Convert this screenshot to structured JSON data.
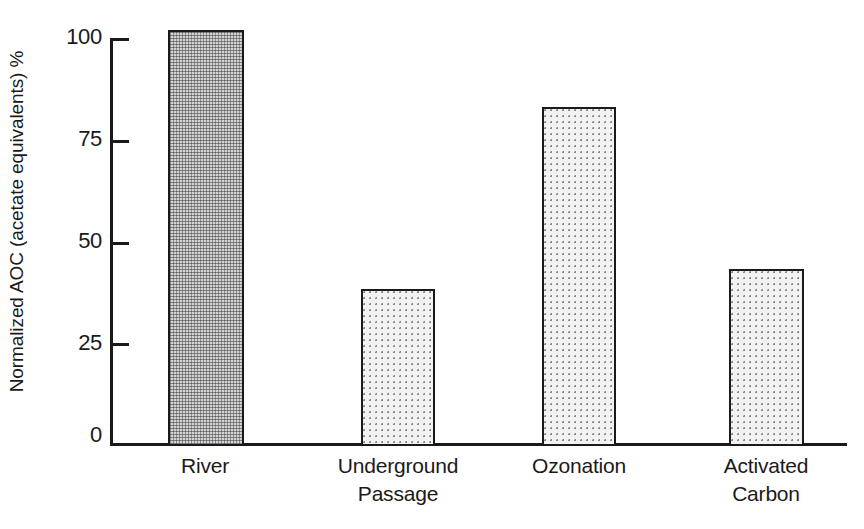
{
  "chart_data": {
    "type": "bar",
    "title": "",
    "subtitle": "",
    "xlabel": "",
    "ylabel": "Normalized AOC (acetate equivalents) %",
    "categories": [
      "River",
      "Underground\nPassage",
      "Ozonation",
      "Activated\nCarbon"
    ],
    "values": [
      102,
      38,
      83,
      43
    ],
    "ylim": [
      0,
      100
    ],
    "yticks": [
      "0",
      "25",
      "50",
      "75",
      "100"
    ],
    "ytick_values": [
      0,
      25,
      50,
      75,
      100
    ],
    "xticks_visible": false,
    "grid": false,
    "legend": null,
    "annotations": [],
    "series": [
      {
        "name": "Normalized AOC",
        "values": [
          102,
          38,
          83,
          43
        ]
      }
    ],
    "bar_styles": [
      {
        "category": "River",
        "fill": "dense-stipple",
        "edge_color": "#1a1a1a"
      },
      {
        "category": "Underground Passage",
        "fill": "sparse-dots",
        "edge_color": "#1a1a1a"
      },
      {
        "category": "Ozonation",
        "fill": "sparse-dots",
        "edge_color": "#1a1a1a"
      },
      {
        "category": "Activated Carbon",
        "fill": "sparse-dots",
        "edge_color": "#1a1a1a"
      }
    ],
    "colors": {
      "axis": "#1a1a1a",
      "bar_dense_fill": "#d2d2d2",
      "bar_sparse_fill": "#f2f2f2",
      "background": "#ffffff",
      "text": "#1a1a1a"
    }
  },
  "axis": {
    "y_title": "Normalized AOC (acetate equivalents) %",
    "y_labels": {
      "t0": "0",
      "t25": "25",
      "t50": "50",
      "t75": "75",
      "t100": "100"
    },
    "x_labels": {
      "c0": "River",
      "c1": "Underground\nPassage",
      "c2": "Ozonation",
      "c3": "Activated\nCarbon"
    }
  }
}
